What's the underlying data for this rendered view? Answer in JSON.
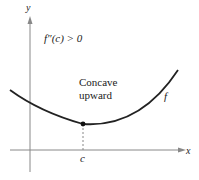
{
  "figure": {
    "axes": {
      "x_label": "x",
      "y_label": "y"
    },
    "condition_label": "f″(c) > 0",
    "annotation": {
      "line1": "Concave",
      "line2": "upward"
    },
    "curve_label": "f",
    "point_label": "c",
    "colors": {
      "curve": "#222222",
      "axis": "#888888",
      "background": "#ffffff"
    }
  }
}
